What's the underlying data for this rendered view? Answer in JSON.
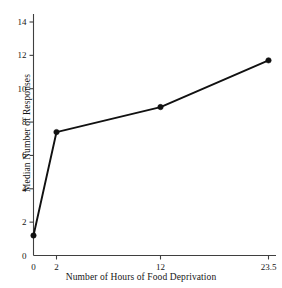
{
  "chart_data": {
    "type": "line",
    "title": "",
    "xlabel": "Number of Hours of Food Deprivation",
    "ylabel": "Median Number of Responses",
    "x_tick_labels": [
      "0",
      "2",
      "12",
      "23.5"
    ],
    "x_values": [
      0,
      2,
      12,
      23.5
    ],
    "y_tick_labels": [
      "0",
      "2",
      "4",
      "6",
      "8",
      "10",
      "12",
      "14"
    ],
    "y_ticks": [
      0,
      2,
      4,
      6,
      8,
      10,
      12,
      14
    ],
    "ylim": [
      0,
      14.6
    ],
    "grid": false,
    "legend": false,
    "marker": "filled-circle",
    "line_color": "#111111",
    "background_color": "#ffffff",
    "series": [
      {
        "name": "Median Number of Responses",
        "categories": [
          "0",
          "2",
          "12",
          "23.5"
        ],
        "values": [
          1.2,
          7.4,
          8.9,
          11.7
        ]
      }
    ]
  },
  "axes": {
    "x_axis_name": "x-axis",
    "y_axis_name": "y-axis"
  }
}
